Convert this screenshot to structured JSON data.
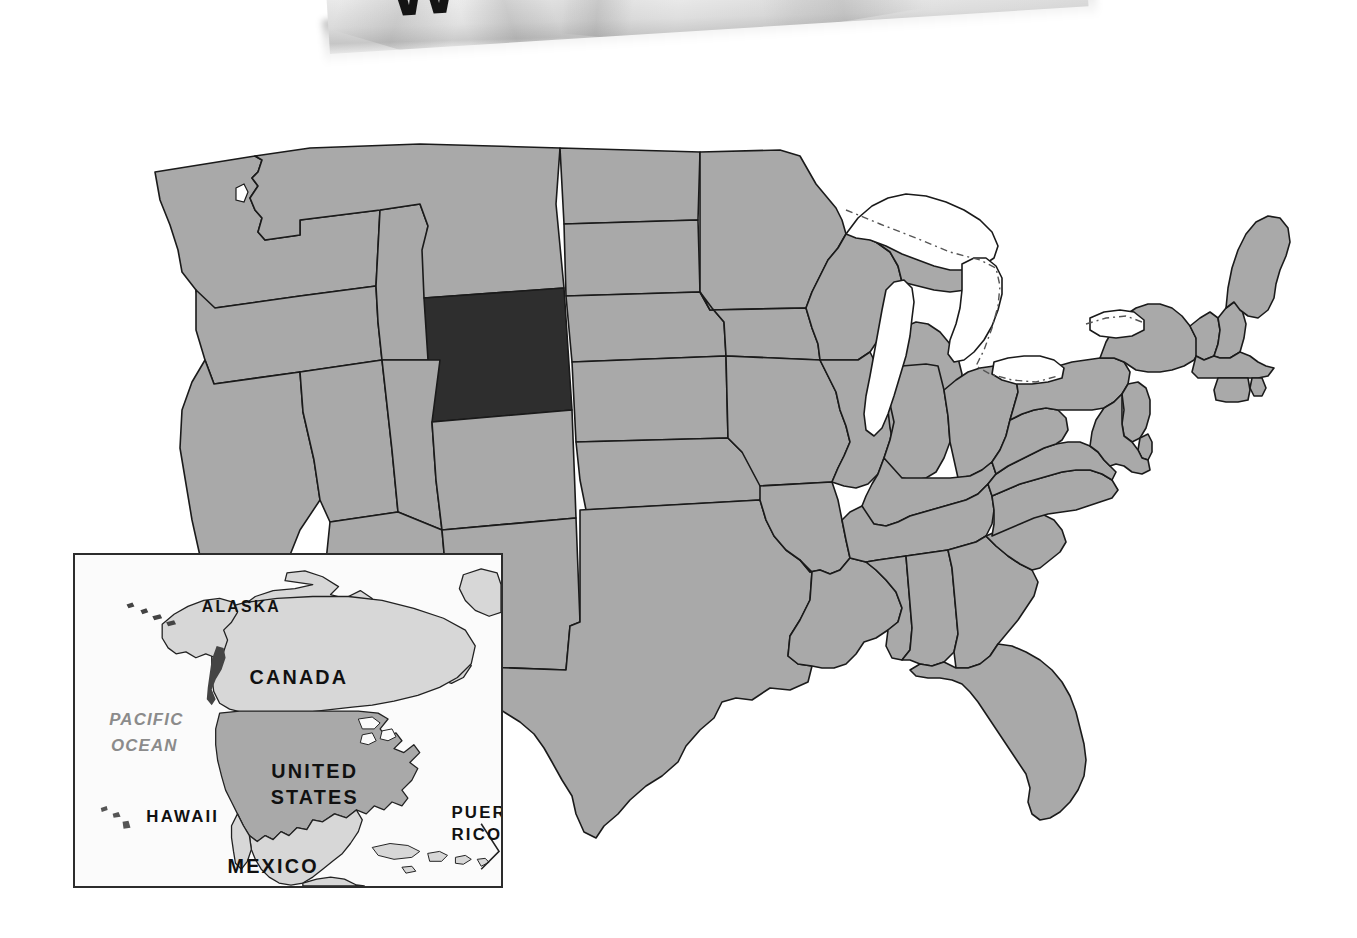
{
  "page": {
    "background_color": "#ffffff",
    "width": 1357,
    "height": 938
  },
  "paper": {
    "title_partial": "W",
    "description": "crumpled paper photo partially visible at top edge",
    "paper_color": "#f2f2f2",
    "text_color": "#141414"
  },
  "main_map": {
    "name": "united-states-map",
    "highlighted_state": "Wyoming",
    "highlight_color": "#2e2e2e",
    "state_fill_color": "#a9a9a9",
    "border_color": "#1a1a1a",
    "water_color": "#ffffff",
    "background_color": "#ffffff"
  },
  "inset": {
    "name": "north-america-locator-inset",
    "border_color": "#2c2c2c",
    "background_color": "#fbfbfb",
    "united_states_fill": "#a9a9a9",
    "neighbor_fill": "#d7d7d7",
    "labels": [
      {
        "id": "alaska",
        "text": "ALASKA",
        "x": 168,
        "y": 58,
        "size": 16,
        "style": "bold",
        "anchor": "middle"
      },
      {
        "id": "canada",
        "text": "CANADA",
        "x": 226,
        "y": 131,
        "size": 20,
        "style": "bold",
        "anchor": "middle"
      },
      {
        "id": "pacific",
        "text": "PACIFIC",
        "x": 72,
        "y": 172,
        "size": 17,
        "style": "italic",
        "anchor": "middle"
      },
      {
        "id": "ocean",
        "text": "OCEAN",
        "x": 70,
        "y": 198,
        "size": 17,
        "style": "italic",
        "anchor": "middle"
      },
      {
        "id": "united-states",
        "text": "UNITED",
        "x": 242,
        "y": 226,
        "size": 20,
        "style": "bold",
        "anchor": "middle"
      },
      {
        "id": "states",
        "text": "STATES",
        "x": 242,
        "y": 252,
        "size": 20,
        "style": "bold",
        "anchor": "middle"
      },
      {
        "id": "hawaii",
        "text": "HAWAII",
        "x": 72,
        "y": 270,
        "size": 17,
        "style": "bold",
        "anchor": "start"
      },
      {
        "id": "puerto-rico",
        "text": "PUERTO",
        "x": 380,
        "y": 266,
        "size": 17,
        "style": "bold",
        "anchor": "start"
      },
      {
        "id": "rico",
        "text": "RICO",
        "x": 380,
        "y": 288,
        "size": 17,
        "style": "bold",
        "anchor": "start"
      },
      {
        "id": "mexico",
        "text": "MEXICO",
        "x": 200,
        "y": 322,
        "size": 20,
        "style": "bold",
        "anchor": "middle"
      }
    ]
  }
}
